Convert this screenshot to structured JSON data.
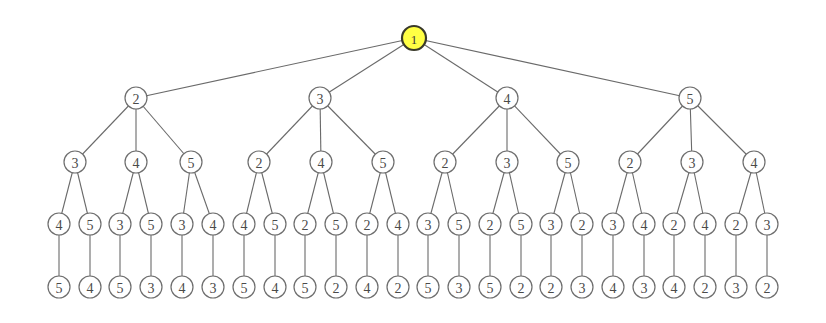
{
  "diagram": {
    "type": "tree",
    "root_color": "#ffff44",
    "node_radius": 11,
    "root_radius": 12,
    "levels_y": [
      38,
      98,
      162,
      224,
      287
    ],
    "nodes": [
      {
        "id": "r",
        "label": "1",
        "x": 414,
        "y": 38,
        "parent": null,
        "root": true
      },
      {
        "id": "a",
        "label": "2",
        "x": 136,
        "y": 98,
        "parent": "r"
      },
      {
        "id": "b",
        "label": "3",
        "x": 320,
        "y": 98,
        "parent": "r"
      },
      {
        "id": "c",
        "label": "4",
        "x": 507,
        "y": 98,
        "parent": "r"
      },
      {
        "id": "d",
        "label": "5",
        "x": 690,
        "y": 98,
        "parent": "r"
      },
      {
        "id": "a1",
        "label": "3",
        "x": 75,
        "y": 162,
        "parent": "a"
      },
      {
        "id": "a2",
        "label": "4",
        "x": 136,
        "y": 162,
        "parent": "a"
      },
      {
        "id": "a3",
        "label": "5",
        "x": 191,
        "y": 162,
        "parent": "a"
      },
      {
        "id": "b1",
        "label": "2",
        "x": 259,
        "y": 162,
        "parent": "b"
      },
      {
        "id": "b2",
        "label": "4",
        "x": 321,
        "y": 162,
        "parent": "b"
      },
      {
        "id": "b3",
        "label": "5",
        "x": 383,
        "y": 162,
        "parent": "b"
      },
      {
        "id": "c1",
        "label": "2",
        "x": 445,
        "y": 162,
        "parent": "c"
      },
      {
        "id": "c2",
        "label": "3",
        "x": 507,
        "y": 162,
        "parent": "c"
      },
      {
        "id": "c3",
        "label": "5",
        "x": 568,
        "y": 162,
        "parent": "c"
      },
      {
        "id": "d1",
        "label": "2",
        "x": 630,
        "y": 162,
        "parent": "d"
      },
      {
        "id": "d2",
        "label": "3",
        "x": 692,
        "y": 162,
        "parent": "d"
      },
      {
        "id": "d3",
        "label": "4",
        "x": 754,
        "y": 162,
        "parent": "d"
      },
      {
        "id": "a1a",
        "label": "4",
        "x": 59,
        "y": 224,
        "parent": "a1"
      },
      {
        "id": "a1b",
        "label": "5",
        "x": 90,
        "y": 224,
        "parent": "a1"
      },
      {
        "id": "a2a",
        "label": "3",
        "x": 120,
        "y": 224,
        "parent": "a2"
      },
      {
        "id": "a2b",
        "label": "5",
        "x": 151,
        "y": 224,
        "parent": "a2"
      },
      {
        "id": "a3a",
        "label": "3",
        "x": 182,
        "y": 224,
        "parent": "a3"
      },
      {
        "id": "a3b",
        "label": "4",
        "x": 213,
        "y": 224,
        "parent": "a3"
      },
      {
        "id": "b1a",
        "label": "4",
        "x": 244,
        "y": 224,
        "parent": "b1"
      },
      {
        "id": "b1b",
        "label": "5",
        "x": 275,
        "y": 224,
        "parent": "b1"
      },
      {
        "id": "b2a",
        "label": "2",
        "x": 305,
        "y": 224,
        "parent": "b2"
      },
      {
        "id": "b2b",
        "label": "5",
        "x": 336,
        "y": 224,
        "parent": "b2"
      },
      {
        "id": "b3a",
        "label": "2",
        "x": 367,
        "y": 224,
        "parent": "b3"
      },
      {
        "id": "b3b",
        "label": "4",
        "x": 398,
        "y": 224,
        "parent": "b3"
      },
      {
        "id": "c1a",
        "label": "3",
        "x": 428,
        "y": 224,
        "parent": "c1"
      },
      {
        "id": "c1b",
        "label": "5",
        "x": 459,
        "y": 224,
        "parent": "c1"
      },
      {
        "id": "c2a",
        "label": "2",
        "x": 490,
        "y": 224,
        "parent": "c2"
      },
      {
        "id": "c2b",
        "label": "5",
        "x": 521,
        "y": 224,
        "parent": "c2"
      },
      {
        "id": "c3a",
        "label": "3",
        "x": 551,
        "y": 224,
        "parent": "c3"
      },
      {
        "id": "c3b",
        "label": "2",
        "x": 582,
        "y": 224,
        "parent": "c3"
      },
      {
        "id": "d1a",
        "label": "3",
        "x": 613,
        "y": 224,
        "parent": "d1"
      },
      {
        "id": "d1b",
        "label": "4",
        "x": 644,
        "y": 224,
        "parent": "d1"
      },
      {
        "id": "d2a",
        "label": "2",
        "x": 674,
        "y": 224,
        "parent": "d2"
      },
      {
        "id": "d2b",
        "label": "4",
        "x": 705,
        "y": 224,
        "parent": "d2"
      },
      {
        "id": "d3a",
        "label": "2",
        "x": 736,
        "y": 224,
        "parent": "d3"
      },
      {
        "id": "d3b",
        "label": "3",
        "x": 767,
        "y": 224,
        "parent": "d3"
      },
      {
        "id": "a1aL",
        "label": "5",
        "x": 59,
        "y": 287,
        "parent": "a1a"
      },
      {
        "id": "a1bL",
        "label": "4",
        "x": 90,
        "y": 287,
        "parent": "a1b"
      },
      {
        "id": "a2aL",
        "label": "5",
        "x": 120,
        "y": 287,
        "parent": "a2a"
      },
      {
        "id": "a2bL",
        "label": "3",
        "x": 151,
        "y": 287,
        "parent": "a2b"
      },
      {
        "id": "a3aL",
        "label": "4",
        "x": 182,
        "y": 287,
        "parent": "a3a"
      },
      {
        "id": "a3bL",
        "label": "3",
        "x": 213,
        "y": 287,
        "parent": "a3b"
      },
      {
        "id": "b1aL",
        "label": "5",
        "x": 244,
        "y": 287,
        "parent": "b1a"
      },
      {
        "id": "b1bL",
        "label": "4",
        "x": 275,
        "y": 287,
        "parent": "b1b"
      },
      {
        "id": "b2aL",
        "label": "5",
        "x": 305,
        "y": 287,
        "parent": "b2a"
      },
      {
        "id": "b2bL",
        "label": "2",
        "x": 336,
        "y": 287,
        "parent": "b2b"
      },
      {
        "id": "b3aL",
        "label": "4",
        "x": 367,
        "y": 287,
        "parent": "b3a"
      },
      {
        "id": "b3bL",
        "label": "2",
        "x": 398,
        "y": 287,
        "parent": "b3b"
      },
      {
        "id": "c1aL",
        "label": "5",
        "x": 428,
        "y": 287,
        "parent": "c1a"
      },
      {
        "id": "c1bL",
        "label": "3",
        "x": 459,
        "y": 287,
        "parent": "c1b"
      },
      {
        "id": "c2aL",
        "label": "5",
        "x": 490,
        "y": 287,
        "parent": "c2a"
      },
      {
        "id": "c2bL",
        "label": "2",
        "x": 521,
        "y": 287,
        "parent": "c2b"
      },
      {
        "id": "c3aL",
        "label": "2",
        "x": 551,
        "y": 287,
        "parent": "c3a"
      },
      {
        "id": "c3bL",
        "label": "3",
        "x": 582,
        "y": 287,
        "parent": "c3b"
      },
      {
        "id": "d1aL",
        "label": "4",
        "x": 613,
        "y": 287,
        "parent": "d1a"
      },
      {
        "id": "d1bL",
        "label": "3",
        "x": 644,
        "y": 287,
        "parent": "d1b"
      },
      {
        "id": "d2aL",
        "label": "4",
        "x": 674,
        "y": 287,
        "parent": "d2a"
      },
      {
        "id": "d2bL",
        "label": "2",
        "x": 705,
        "y": 287,
        "parent": "d2b"
      },
      {
        "id": "d3aL",
        "label": "3",
        "x": 736,
        "y": 287,
        "parent": "d3a"
      },
      {
        "id": "d3bL",
        "label": "2",
        "x": 767,
        "y": 287,
        "parent": "d3b"
      }
    ]
  }
}
